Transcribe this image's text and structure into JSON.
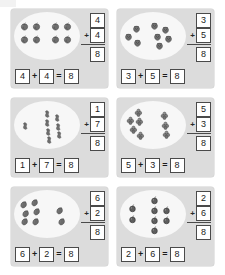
{
  "worksheet": {
    "title": "Addition picture problems making 8",
    "problems": [
      {
        "id": "problem-1",
        "fruit": "apple",
        "left_count": 4,
        "right_count": 4,
        "vertical": {
          "addend1": "4",
          "addend2": "4",
          "plus": "+",
          "sum": "8"
        },
        "equation": {
          "a": "4",
          "plus": "+",
          "b": "4",
          "equals": "=",
          "result": "8"
        },
        "left_positions": [
          [
            6,
            10
          ],
          [
            18,
            10
          ],
          [
            6,
            23
          ],
          [
            18,
            23
          ]
        ],
        "right_positions": [
          [
            37,
            10
          ],
          [
            49,
            10
          ],
          [
            37,
            23
          ],
          [
            49,
            23
          ]
        ]
      },
      {
        "id": "problem-2",
        "fruit": "strawberry",
        "left_count": 3,
        "right_count": 5,
        "vertical": {
          "addend1": "3",
          "addend2": "5",
          "plus": "+",
          "sum": "8"
        },
        "equation": {
          "a": "3",
          "plus": "+",
          "b": "5",
          "equals": "=",
          "result": "8"
        },
        "left_positions": [
          [
            12,
            12
          ],
          [
            4,
            20
          ],
          [
            13,
            26
          ]
        ],
        "right_positions": [
          [
            30,
            9
          ],
          [
            41,
            13
          ],
          [
            33,
            20
          ],
          [
            44,
            22
          ],
          [
            35,
            29
          ]
        ]
      },
      {
        "id": "problem-3",
        "fruit": "peanut",
        "left_count": 1,
        "right_count": 7,
        "vertical": {
          "addend1": "1",
          "addend2": "7",
          "plus": "+",
          "sum": "8"
        },
        "equation": {
          "a": "1",
          "plus": "+",
          "b": "7",
          "equals": "=",
          "result": "8"
        },
        "left_positions": [
          [
            7,
            20
          ]
        ],
        "right_positions": [
          [
            29,
            8
          ],
          [
            39,
            12
          ],
          [
            29,
            17
          ],
          [
            40,
            21
          ],
          [
            30,
            26
          ],
          [
            41,
            29
          ],
          [
            31,
            34
          ]
        ]
      },
      {
        "id": "problem-4",
        "fruit": "grape",
        "left_count": 5,
        "right_count": 3,
        "vertical": {
          "addend1": "5",
          "addend2": "3",
          "plus": "+",
          "sum": "8"
        },
        "equation": {
          "a": "5",
          "plus": "+",
          "b": "3",
          "equals": "=",
          "result": "8"
        },
        "left_positions": [
          [
            14,
            7
          ],
          [
            6,
            15
          ],
          [
            15,
            16
          ],
          [
            9,
            24
          ],
          [
            16,
            30
          ]
        ],
        "right_positions": [
          [
            40,
            10
          ],
          [
            41,
            20
          ],
          [
            42,
            29
          ]
        ]
      },
      {
        "id": "problem-5",
        "fruit": "eggplant",
        "left_count": 6,
        "right_count": 2,
        "vertical": {
          "addend1": "6",
          "addend2": "2",
          "plus": "+",
          "sum": "8"
        },
        "equation": {
          "a": "6",
          "plus": "+",
          "b": "2",
          "equals": "=",
          "result": "8"
        },
        "left_positions": [
          [
            5,
            10
          ],
          [
            16,
            8
          ],
          [
            7,
            19
          ],
          [
            18,
            17
          ],
          [
            6,
            27
          ],
          [
            17,
            27
          ]
        ],
        "right_positions": [
          [
            41,
            16
          ],
          [
            43,
            27
          ]
        ]
      },
      {
        "id": "problem-6",
        "fruit": "cherry",
        "left_count": 2,
        "right_count": 6,
        "vertical": {
          "addend1": "2",
          "addend2": "6",
          "plus": "+",
          "sum": "8"
        },
        "equation": {
          "a": "2",
          "plus": "+",
          "b": "6",
          "equals": "=",
          "result": "8"
        },
        "left_positions": [
          [
            8,
            14
          ],
          [
            8,
            25
          ]
        ],
        "right_positions": [
          [
            30,
            6
          ],
          [
            30,
            16
          ],
          [
            42,
            16
          ],
          [
            30,
            26
          ],
          [
            42,
            26
          ],
          [
            30,
            36
          ]
        ]
      }
    ]
  },
  "colors": {
    "panel_background": "#dcdcdc",
    "oval_fill": "#f7f7f7",
    "box_border": "#4a4a4a",
    "box_fill": "#ffffff",
    "text": "#1c1c1c",
    "object_fill": "#6e6e6e"
  }
}
